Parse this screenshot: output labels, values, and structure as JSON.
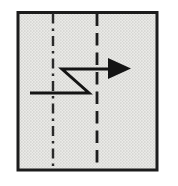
{
  "figure": {
    "type": "diagram",
    "canvas": {
      "width": 178,
      "height": 186,
      "viewbox": "0 0 178 186",
      "background": "#ffffff"
    },
    "colors": {
      "ink": "#1c1c1c",
      "paper_fill_light": "#eaeae7",
      "paper_fill_dot": "#c9c9c6",
      "paper_fill_dot2": "#d3d3d0"
    },
    "square": {
      "x": 18,
      "y": 12.5,
      "width": 139,
      "height": 157.5,
      "stroke": "#1c1c1c",
      "stroke_width": 3
    },
    "mountain_fold_line": {
      "style": "dash-dot",
      "x1": 53,
      "y1": 13.5,
      "x2": 53,
      "y2": 168,
      "stroke": "#2a2a2a",
      "stroke_width": 2.4,
      "dasharray": "10 5 2.5 5"
    },
    "valley_fold_line": {
      "style": "dashed",
      "x1": 97,
      "y1": 13.5,
      "x2": 97,
      "y2": 168,
      "stroke": "#1c1c1c",
      "stroke_width": 2.8,
      "dasharray": "12.5 7"
    },
    "pleat_arrow": {
      "shaft_path": "M 30 93 L 89 93 L 62 69 L 110 69",
      "head_points": "131,68.5 108,58 108,79",
      "stroke": "#141414",
      "stroke_width": 3
    }
  }
}
